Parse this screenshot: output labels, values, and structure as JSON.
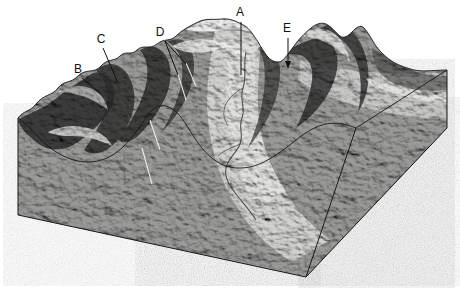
{
  "figure": {
    "kind": "block-diagram",
    "background_color": "#ffffff",
    "outline_color": "#1a1a1a",
    "left_face_color": "#d8d8d6",
    "right_face_color": "#a9a9a7",
    "terrain_tone_light": "#e9e9e7",
    "terrain_tone_mid": "#8d8d8b",
    "terrain_tone_dark": "#242424",
    "width": 460,
    "height": 291
  },
  "labels": [
    {
      "id": "A",
      "text": "A",
      "x": 240,
      "y": 16,
      "leader": "line",
      "tip_x": 241,
      "tip_y": 75
    },
    {
      "id": "B",
      "text": "B",
      "x": 78,
      "y": 73,
      "leader": "line",
      "tip_x": 101,
      "tip_y": 94
    },
    {
      "id": "C",
      "text": "C",
      "x": 101,
      "y": 43,
      "leader": "line",
      "tip_x": 118,
      "tip_y": 83
    },
    {
      "id": "D",
      "text": "D",
      "x": 160,
      "y": 36,
      "leader": "forked",
      "tip_x": 186,
      "tip_y": 64,
      "tip2_x": 178,
      "tip2_y": 75
    },
    {
      "id": "E",
      "text": "E",
      "x": 287,
      "y": 32,
      "leader": "arrow",
      "tip_x": 288,
      "tip_y": 68
    }
  ],
  "terrain_features": {
    "valley_floor": "braided meandering river channel",
    "left_edge_profile": "U-shaped glacial valley cross-section",
    "ridges": "serrated aretes with horn peaks",
    "peak_count": 5
  },
  "caption": ""
}
